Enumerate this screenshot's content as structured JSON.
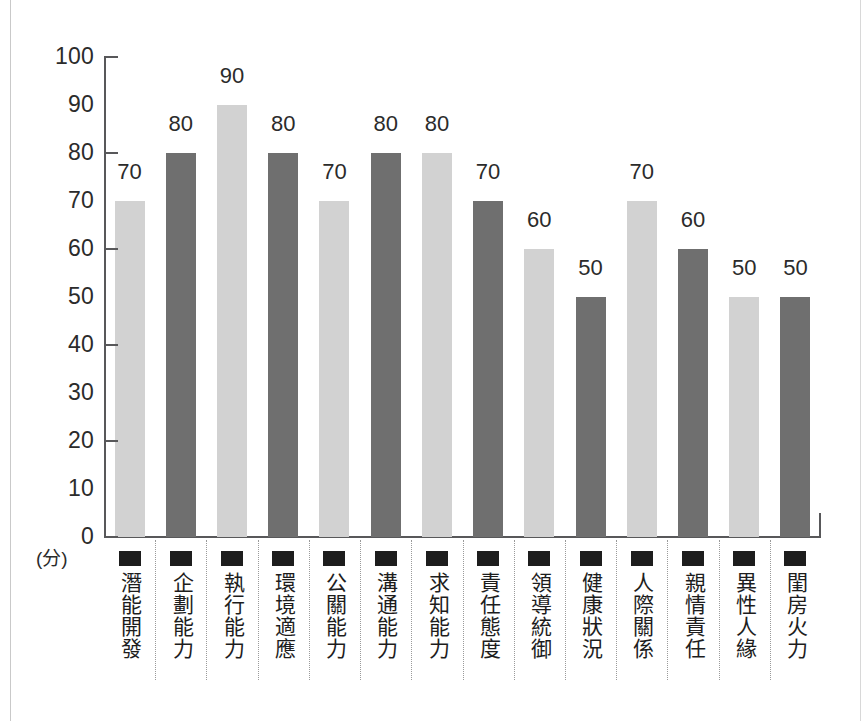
{
  "chart_data": {
    "type": "bar",
    "title": "",
    "subtitle": "",
    "xlabel": "",
    "ylabel": "(分)",
    "ylim": [
      0,
      100
    ],
    "ytick_labels": [
      "100",
      "90",
      "80",
      "70",
      "60",
      "50",
      "40",
      "30",
      "20",
      "10",
      "0"
    ],
    "ytick_values": [
      100,
      90,
      80,
      70,
      60,
      50,
      40,
      30,
      20,
      10,
      0
    ],
    "major_ticks": [
      100,
      80,
      60,
      40,
      20,
      0
    ],
    "grid": false,
    "legend": "none",
    "categories": [
      "潛能開發",
      "企劃能力",
      "執行能力",
      "環境適應",
      "公關能力",
      "溝通能力",
      "求知能力",
      "責任態度",
      "領導統御",
      "健康狀況",
      "人際關係",
      "親情責任",
      "異性人緣",
      "閨房火力"
    ],
    "values": [
      70,
      80,
      90,
      80,
      70,
      80,
      80,
      70,
      60,
      50,
      70,
      60,
      50,
      50
    ],
    "data_labels": [
      "70",
      "80",
      "90",
      "80",
      "70",
      "80",
      "80",
      "70",
      "60",
      "50",
      "70",
      "60",
      "50",
      "50"
    ],
    "bar_colors": [
      "#d2d2d2",
      "#6f6f6f",
      "#d2d2d2",
      "#6f6f6f",
      "#d2d2d2",
      "#6f6f6f",
      "#d2d2d2",
      "#6f6f6f",
      "#d2d2d2",
      "#6f6f6f",
      "#d2d2d2",
      "#6f6f6f",
      "#d2d2d2",
      "#6f6f6f"
    ],
    "bar_shades": [
      "light",
      "dark",
      "light",
      "dark",
      "light",
      "dark",
      "light",
      "dark",
      "light",
      "dark",
      "light",
      "dark",
      "light",
      "dark"
    ],
    "colors": {
      "light_bar": "#d2d2d2",
      "dark_bar": "#6f6f6f",
      "axis": "#58585a",
      "text": "#2b2b2b",
      "separator": "#9a9a9a",
      "background": "#ffffff"
    },
    "category_marker": "filled-square"
  }
}
